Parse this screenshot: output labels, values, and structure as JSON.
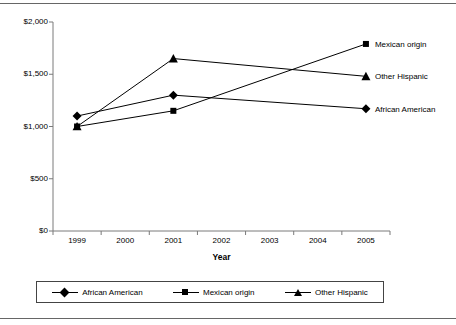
{
  "chart_data": {
    "type": "line",
    "title": "",
    "subtitle": "",
    "xlabel": "Year",
    "ylabel": "",
    "categories": [
      "1999",
      "2000",
      "2001",
      "2002",
      "2003",
      "2004",
      "2005"
    ],
    "x": [
      1999,
      2001,
      2005
    ],
    "ylim": [
      0,
      2000
    ],
    "xlim": [
      1999,
      2005
    ],
    "ytick_labels": [
      "$2,000",
      "$1,500",
      "$1,000",
      "$500",
      "$0"
    ],
    "ytick_values": [
      2000,
      1500,
      1000,
      500,
      0
    ],
    "xtick_labels": [
      "1999",
      "2000",
      "2001",
      "2002",
      "2003",
      "2004",
      "2005"
    ],
    "grid": false,
    "legend_position": "bottom",
    "series": [
      {
        "name": "African American",
        "marker": "diamond",
        "x": [
          1999,
          2001,
          2005
        ],
        "values": [
          1100,
          1300,
          1170
        ],
        "end_label": "African American"
      },
      {
        "name": "Mexican origin",
        "marker": "square",
        "x": [
          1999,
          2001,
          2005
        ],
        "values": [
          1000,
          1150,
          1790
        ],
        "end_label": "Mexican origin"
      },
      {
        "name": "Other Hispanic",
        "marker": "triangle",
        "x": [
          1999,
          2001,
          2005
        ],
        "values": [
          1000,
          1650,
          1480
        ],
        "end_label": "Other Hispanic"
      }
    ]
  },
  "legend": {
    "items": [
      {
        "label": "African American",
        "marker": "diamond"
      },
      {
        "label": "Mexican origin",
        "marker": "square"
      },
      {
        "label": "Other Hispanic",
        "marker": "triangle"
      }
    ]
  },
  "axis": {
    "x_title": "Year"
  }
}
